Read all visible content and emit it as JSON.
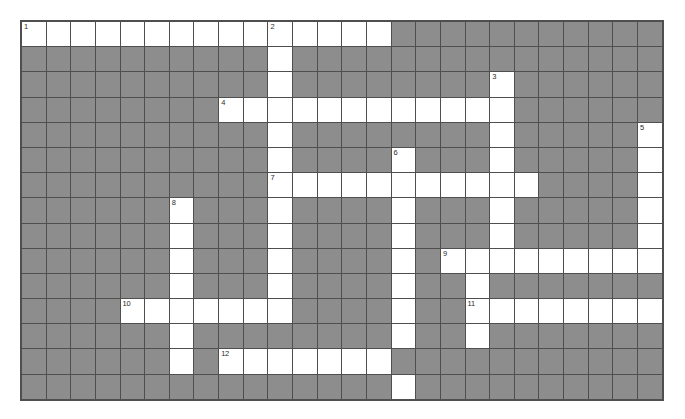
{
  "puzzle": {
    "title": "Crossword Grid",
    "rows": 15,
    "cols": 26,
    "colors": {
      "block": "#8d8d8d",
      "open": "#ffffff",
      "gridline": "#4f4f4f",
      "number": "#2a2a2a",
      "page_background": "#ffffff"
    },
    "numbers": [
      {
        "label": "1",
        "row": 0,
        "col": 0
      },
      {
        "label": "2",
        "row": 0,
        "col": 10
      },
      {
        "label": "3",
        "row": 2,
        "col": 19
      },
      {
        "label": "4",
        "row": 3,
        "col": 8
      },
      {
        "label": "5",
        "row": 4,
        "col": 25
      },
      {
        "label": "6",
        "row": 5,
        "col": 15
      },
      {
        "label": "7",
        "row": 6,
        "col": 10
      },
      {
        "label": "8",
        "row": 7,
        "col": 6
      },
      {
        "label": "9",
        "row": 9,
        "col": 17
      },
      {
        "label": "10",
        "row": 11,
        "col": 4
      },
      {
        "label": "11",
        "row": 11,
        "col": 18
      },
      {
        "label": "12",
        "row": 13,
        "col": 8
      }
    ],
    "grid": [
      "OOOOOOOOOOOOOOO###########",
      "##########O###############",
      "##########O########O######",
      "########OOOOOOOOOOOO######",
      "##########O########O#####O",
      "##########O####O###O#####O",
      "##########OOOOOOOOOOO####O",
      "######O###O####O###O#####O",
      "######O###O####O###O#####O",
      "######O###O####O#OOOOOOOOO",
      "######O###O####O##O#######",
      "####OOOOOOO####O##OOOOOOOO",
      "######O########O##O#######",
      "######O#OOOOOOO###########",
      "###############O##########"
    ]
  }
}
